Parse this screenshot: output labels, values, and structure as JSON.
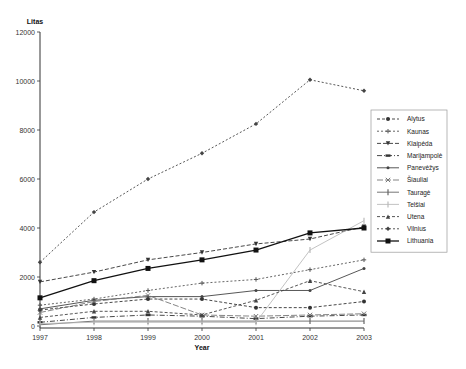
{
  "chart_data": {
    "type": "line",
    "title": "",
    "xlabel": "Year",
    "ylabel": "Litas",
    "x": [
      "1997",
      "1998",
      "1999",
      "2000",
      "2001",
      "2002",
      "2003"
    ],
    "yticks": [
      "0",
      "2000",
      "4000",
      "6000",
      "8000",
      "10000",
      "12000"
    ],
    "ylim": [
      0,
      12000
    ],
    "grid": false,
    "legend_position": "right",
    "series": [
      {
        "name": "Alytus",
        "marker": "circle",
        "dash": "3,2",
        "color": "#333333",
        "values": [
          650,
          900,
          1100,
          1100,
          750,
          750,
          1000
        ]
      },
      {
        "name": "Kaunas",
        "marker": "cross",
        "dash": "2,2",
        "color": "#555555",
        "values": [
          850,
          1100,
          1450,
          1750,
          1900,
          2300,
          2700
        ]
      },
      {
        "name": "Klaipėda",
        "marker": "triangle-down",
        "dash": "4,2",
        "color": "#333333",
        "values": [
          1800,
          2200,
          2700,
          3000,
          3350,
          3550,
          4050
        ]
      },
      {
        "name": "Marijampolė",
        "marker": "bar",
        "dash": "5,2,1,2",
        "color": "#333333",
        "values": [
          150,
          350,
          450,
          400,
          300,
          400,
          450
        ]
      },
      {
        "name": "Panevėžys",
        "marker": "dot",
        "dash": "",
        "color": "#444444",
        "values": [
          700,
          1050,
          1200,
          1200,
          1450,
          1450,
          2350
        ]
      },
      {
        "name": "Šiauliai",
        "marker": "x",
        "dash": "6,2",
        "color": "#777777",
        "values": [
          550,
          1000,
          1250,
          450,
          400,
          450,
          500
        ]
      },
      {
        "name": "Tauragė",
        "marker": "vbar",
        "dash": "",
        "color": "#666666",
        "values": [
          50,
          200,
          200,
          200,
          200,
          200,
          200
        ]
      },
      {
        "name": "Telšiai",
        "marker": "vbar",
        "dash": "",
        "color": "#bbbbbb",
        "values": [
          100,
          150,
          150,
          150,
          150,
          3100,
          4300
        ]
      },
      {
        "name": "Utena",
        "marker": "triangle-up",
        "dash": "3,2",
        "color": "#444444",
        "values": [
          350,
          600,
          600,
          450,
          1050,
          1850,
          1400
        ]
      },
      {
        "name": "Vilnius",
        "marker": "diamond",
        "dash": "2,2",
        "color": "#444444",
        "values": [
          2600,
          4650,
          6000,
          7050,
          8250,
          10050,
          9600
        ]
      },
      {
        "name": "Lithuania",
        "marker": "square",
        "dash": "",
        "color": "#111111",
        "values": [
          1150,
          1850,
          2350,
          2700,
          3100,
          3800,
          4000
        ]
      }
    ]
  }
}
